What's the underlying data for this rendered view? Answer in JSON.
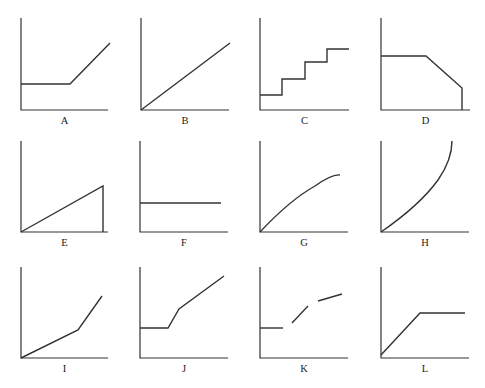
{
  "figure": {
    "line_color": "#333333",
    "background": "#ffffff",
    "graphs": [
      {
        "label": "A",
        "shape": "flat then rising line",
        "axes": {
          "ox": 21,
          "oy": 110,
          "top": 18,
          "right": 108
        },
        "paths": [
          "M21,84 L70,84 L110,43"
        ]
      },
      {
        "label": "B",
        "shape": "straight line from origin",
        "axes": {
          "ox": 141,
          "oy": 110,
          "top": 18,
          "right": 229
        },
        "paths": [
          "M141,110 L230,43"
        ]
      },
      {
        "label": "C",
        "shape": "staircase increasing",
        "axes": {
          "ox": 260,
          "oy": 110,
          "top": 18,
          "right": 349
        },
        "paths": [
          "M260,95 L282,95 L282,79 L305,79 L305,62 L327,62 L327,49 L349,49"
        ]
      },
      {
        "label": "D",
        "shape": "flat then decreasing then vertical drop",
        "axes": {
          "ox": 381,
          "oy": 110,
          "top": 18,
          "right": 470
        },
        "paths": [
          "M381,56 L426,56 L462,88 L462,110"
        ]
      },
      {
        "label": "E",
        "shape": "rising line then vertical drop",
        "axes": {
          "ox": 21,
          "oy": 232,
          "top": 141,
          "right": 108
        },
        "paths": [
          "M21,232 L103,186 L103,232"
        ]
      },
      {
        "label": "F",
        "shape": "horizontal constant line",
        "axes": {
          "ox": 140,
          "oy": 232,
          "top": 141,
          "right": 228
        },
        "paths": [
          "M140,203 L221,203"
        ]
      },
      {
        "label": "G",
        "shape": "concave increasing curve",
        "axes": {
          "ox": 260,
          "oy": 232,
          "top": 141,
          "right": 348
        },
        "paths": [
          "M260,232 Q290,200 315,186 Q332,174 340,175"
        ]
      },
      {
        "label": "H",
        "shape": "convex increasing curve",
        "axes": {
          "ox": 381,
          "oy": 232,
          "top": 141,
          "right": 469
        },
        "paths": [
          "M381,232 Q420,205 438,180 Q452,160 452,141"
        ]
      },
      {
        "label": "I",
        "shape": "piecewise linear, slope increases",
        "axes": {
          "ox": 21,
          "oy": 358,
          "top": 267,
          "right": 108
        },
        "paths": [
          "M21,358 L78,330 L102,296"
        ]
      },
      {
        "label": "J",
        "shape": "flat, steep rise, then moderate rise",
        "axes": {
          "ox": 140,
          "oy": 358,
          "top": 267,
          "right": 228
        },
        "paths": [
          "M140,328 L168,328 L179,309 L224,276"
        ]
      },
      {
        "label": "K",
        "shape": "discontinuous segments increasing",
        "axes": {
          "ox": 260,
          "oy": 358,
          "top": 267,
          "right": 348
        },
        "paths": [
          "M260,328 L283,328",
          "M292,323 L308,306",
          "M318,301 L342,294"
        ]
      },
      {
        "label": "L",
        "shape": "rising then flat",
        "axes": {
          "ox": 381,
          "oy": 358,
          "top": 267,
          "right": 469
        },
        "paths": [
          "M381,355 L420,313 L465,313"
        ]
      }
    ]
  }
}
